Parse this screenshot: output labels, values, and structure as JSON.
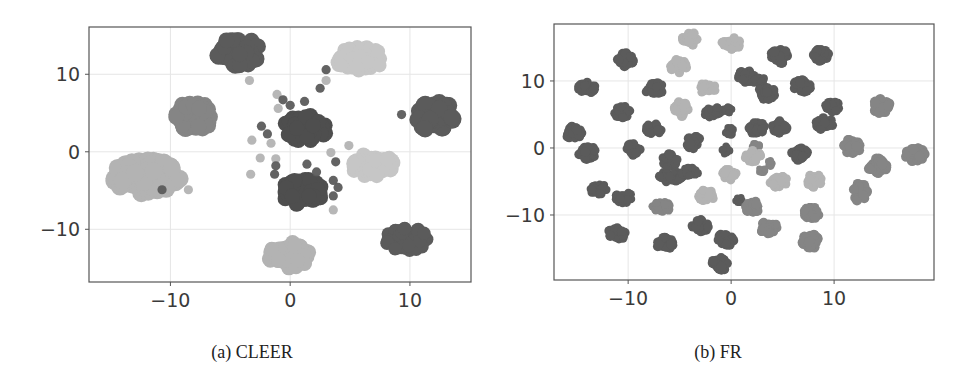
{
  "figure": {
    "captions": [
      "(a) CLEER",
      "(b) FR"
    ]
  },
  "palette": {
    "dark": "#5b5b5b",
    "darker": "#4e4e4e",
    "medium": "#858585",
    "light": "#b3b3b3",
    "lighter": "#c6c6c6",
    "frame": "#555555",
    "grid": "#e6e6e6"
  },
  "chart_data": [
    {
      "type": "scatter",
      "title": "(a) CLEER",
      "xlabel": "",
      "ylabel": "",
      "xlim": [
        -16.8,
        15.1
      ],
      "ylim": [
        -16.8,
        16.1
      ],
      "xticks": [
        -10,
        0,
        10
      ],
      "yticks": [
        -10,
        0,
        10
      ],
      "xtick_labels": [
        "−10",
        "0",
        "10"
      ],
      "ytick_labels": [
        "−10",
        "0",
        "10"
      ],
      "grid": true,
      "legend": null,
      "clusters": [
        {
          "shade": "dark",
          "x": -4.4,
          "y": 12.9,
          "rx": 2.4,
          "ry": 2.4
        },
        {
          "shade": "lighter",
          "x": 5.8,
          "y": 12.0,
          "rx": 2.7,
          "ry": 2.0
        },
        {
          "shade": "medium",
          "x": -8.1,
          "y": 4.5,
          "rx": 2.2,
          "ry": 2.4
        },
        {
          "shade": "light",
          "x": -12.0,
          "y": -3.2,
          "rx": 3.6,
          "ry": 2.8
        },
        {
          "shade": "darker",
          "x": 1.3,
          "y": 3.1,
          "rx": 2.3,
          "ry": 2.3
        },
        {
          "shade": "dark",
          "x": 12.1,
          "y": 4.6,
          "rx": 2.0,
          "ry": 2.6
        },
        {
          "shade": "lighter",
          "x": 6.9,
          "y": -1.8,
          "rx": 2.3,
          "ry": 2.1
        },
        {
          "shade": "darker",
          "x": 0.9,
          "y": -5.2,
          "rx": 2.3,
          "ry": 2.3
        },
        {
          "shade": "dark",
          "x": 9.8,
          "y": -11.3,
          "rx": 2.4,
          "ry": 1.9
        },
        {
          "shade": "light",
          "x": -0.1,
          "y": -13.3,
          "rx": 2.2,
          "ry": 2.2
        }
      ],
      "points": [
        {
          "shade": "light",
          "x": -3.4,
          "y": 9.2
        },
        {
          "shade": "light",
          "x": -1.1,
          "y": 7.4
        },
        {
          "shade": "light",
          "x": -1.0,
          "y": 5.6
        },
        {
          "shade": "dark",
          "x": -0.6,
          "y": 6.7
        },
        {
          "shade": "dark",
          "x": 0.0,
          "y": 6.0
        },
        {
          "shade": "dark",
          "x": 1.2,
          "y": 6.5
        },
        {
          "shade": "dark",
          "x": 3.0,
          "y": 10.6
        },
        {
          "shade": "light",
          "x": 3.0,
          "y": 9.2
        },
        {
          "shade": "dark",
          "x": 2.5,
          "y": 8.2
        },
        {
          "shade": "dark",
          "x": -2.4,
          "y": 3.3
        },
        {
          "shade": "dark",
          "x": -1.9,
          "y": 2.3
        },
        {
          "shade": "light",
          "x": -1.6,
          "y": 1.1
        },
        {
          "shade": "light",
          "x": -3.2,
          "y": 1.5
        },
        {
          "shade": "light",
          "x": -2.5,
          "y": -0.8
        },
        {
          "shade": "light",
          "x": -1.2,
          "y": -0.9
        },
        {
          "shade": "dark",
          "x": -1.2,
          "y": -1.8
        },
        {
          "shade": "dark",
          "x": -1.3,
          "y": -2.9
        },
        {
          "shade": "light",
          "x": -3.3,
          "y": -2.9
        },
        {
          "shade": "dark",
          "x": 9.3,
          "y": 4.8
        },
        {
          "shade": "light",
          "x": 4.9,
          "y": 0.8
        },
        {
          "shade": "light",
          "x": 3.4,
          "y": -0.1
        },
        {
          "shade": "dark",
          "x": 3.8,
          "y": -1.3
        },
        {
          "shade": "dark",
          "x": 1.4,
          "y": -1.6
        },
        {
          "shade": "dark",
          "x": 2.2,
          "y": -2.6
        },
        {
          "shade": "dark",
          "x": 3.6,
          "y": -3.7
        },
        {
          "shade": "dark",
          "x": 4.0,
          "y": -4.6
        },
        {
          "shade": "dark",
          "x": 3.6,
          "y": -5.7
        },
        {
          "shade": "light",
          "x": 3.6,
          "y": -7.5
        },
        {
          "shade": "dark",
          "x": -10.7,
          "y": -4.9
        },
        {
          "shade": "light",
          "x": -8.5,
          "y": -4.9
        }
      ]
    },
    {
      "type": "scatter",
      "title": "(b) FR",
      "xlabel": "",
      "ylabel": "",
      "xlim": [
        -17.2,
        19.7
      ],
      "ylim": [
        -19.7,
        18.5
      ],
      "xticks": [
        -10,
        0,
        10
      ],
      "yticks": [
        -10,
        0,
        10
      ],
      "xtick_labels": [
        "−10",
        "0",
        "10"
      ],
      "ytick_labels": [
        "−10",
        "0",
        "10"
      ],
      "grid": true,
      "legend": null,
      "clusters": [
        {
          "shade": "light",
          "x": -4.0,
          "y": 16.3,
          "rx": 0.9,
          "ry": 1.3
        },
        {
          "shade": "light",
          "x": 0.0,
          "y": 15.6,
          "rx": 1.2,
          "ry": 1.2
        },
        {
          "shade": "dark",
          "x": -10.3,
          "y": 13.2,
          "rx": 1.0,
          "ry": 1.4
        },
        {
          "shade": "light",
          "x": -5.1,
          "y": 12.2,
          "rx": 1.0,
          "ry": 1.3
        },
        {
          "shade": "dark",
          "x": 4.7,
          "y": 13.7,
          "rx": 1.1,
          "ry": 1.4
        },
        {
          "shade": "dark",
          "x": 8.8,
          "y": 13.8,
          "rx": 1.1,
          "ry": 1.3
        },
        {
          "shade": "dark",
          "x": -14.0,
          "y": 8.9,
          "rx": 1.1,
          "ry": 1.2
        },
        {
          "shade": "dark",
          "x": -7.4,
          "y": 8.8,
          "rx": 1.2,
          "ry": 1.2
        },
        {
          "shade": "light",
          "x": -2.3,
          "y": 9.0,
          "rx": 1.2,
          "ry": 1.1
        },
        {
          "shade": "dark",
          "x": 1.5,
          "y": 10.7,
          "rx": 1.1,
          "ry": 1.2
        },
        {
          "shade": "dark",
          "x": 2.8,
          "y": 10.0,
          "rx": 0.8,
          "ry": 0.9
        },
        {
          "shade": "dark",
          "x": 3.4,
          "y": 8.2,
          "rx": 1.1,
          "ry": 1.3
        },
        {
          "shade": "dark",
          "x": 6.9,
          "y": 9.2,
          "rx": 1.1,
          "ry": 1.3
        },
        {
          "shade": "dark",
          "x": -10.6,
          "y": 5.4,
          "rx": 1.0,
          "ry": 1.2
        },
        {
          "shade": "light",
          "x": -4.9,
          "y": 5.8,
          "rx": 0.9,
          "ry": 1.4
        },
        {
          "shade": "dark",
          "x": -1.7,
          "y": 5.3,
          "rx": 1.3,
          "ry": 1.1
        },
        {
          "shade": "dark",
          "x": -0.3,
          "y": 5.7,
          "rx": 0.6,
          "ry": 0.7
        },
        {
          "shade": "dark",
          "x": 9.8,
          "y": 6.1,
          "rx": 1.1,
          "ry": 1.2
        },
        {
          "shade": "dark",
          "x": 9.1,
          "y": 3.6,
          "rx": 1.1,
          "ry": 1.3
        },
        {
          "shade": "medium",
          "x": 14.6,
          "y": 6.3,
          "rx": 1.0,
          "ry": 1.5
        },
        {
          "shade": "dark",
          "x": -15.3,
          "y": 2.3,
          "rx": 1.0,
          "ry": 1.3
        },
        {
          "shade": "dark",
          "x": -7.5,
          "y": 2.8,
          "rx": 1.1,
          "ry": 1.1
        },
        {
          "shade": "dark",
          "x": -0.2,
          "y": 2.5,
          "rx": 0.6,
          "ry": 0.8
        },
        {
          "shade": "dark",
          "x": 2.4,
          "y": 3.0,
          "rx": 1.1,
          "ry": 1.3
        },
        {
          "shade": "dark",
          "x": 4.7,
          "y": 3.2,
          "rx": 1.1,
          "ry": 1.3
        },
        {
          "shade": "dark",
          "x": -14.0,
          "y": -0.7,
          "rx": 1.1,
          "ry": 1.3
        },
        {
          "shade": "dark",
          "x": -9.5,
          "y": -0.2,
          "rx": 1.0,
          "ry": 1.2
        },
        {
          "shade": "dark",
          "x": -3.7,
          "y": 0.9,
          "rx": 0.9,
          "ry": 1.3
        },
        {
          "shade": "dark",
          "x": -0.5,
          "y": -0.3,
          "rx": 0.5,
          "ry": 0.8
        },
        {
          "shade": "medium",
          "x": 2.4,
          "y": 0.2,
          "rx": 0.5,
          "ry": 0.7
        },
        {
          "shade": "light",
          "x": 2.1,
          "y": -1.3,
          "rx": 1.0,
          "ry": 1.2
        },
        {
          "shade": "dark",
          "x": 6.7,
          "y": -0.8,
          "rx": 1.0,
          "ry": 1.4
        },
        {
          "shade": "medium",
          "x": 11.7,
          "y": 0.3,
          "rx": 1.2,
          "ry": 1.4
        },
        {
          "shade": "medium",
          "x": 17.9,
          "y": -1.1,
          "rx": 1.2,
          "ry": 1.5
        },
        {
          "shade": "dark",
          "x": -6.0,
          "y": -1.9,
          "rx": 1.0,
          "ry": 1.3
        },
        {
          "shade": "dark",
          "x": -5.8,
          "y": -4.3,
          "rx": 1.8,
          "ry": 1.1
        },
        {
          "shade": "dark",
          "x": -4.0,
          "y": -3.6,
          "rx": 1.1,
          "ry": 0.9
        },
        {
          "shade": "light",
          "x": -0.2,
          "y": -4.0,
          "rx": 0.9,
          "ry": 1.2
        },
        {
          "shade": "medium",
          "x": 3.9,
          "y": -2.3,
          "rx": 0.5,
          "ry": 0.6
        },
        {
          "shade": "medium",
          "x": 3.0,
          "y": -3.3,
          "rx": 0.5,
          "ry": 0.6
        },
        {
          "shade": "light",
          "x": 4.6,
          "y": -5.0,
          "rx": 1.1,
          "ry": 1.2
        },
        {
          "shade": "light",
          "x": 8.1,
          "y": -4.9,
          "rx": 0.9,
          "ry": 1.3
        },
        {
          "shade": "medium",
          "x": 14.2,
          "y": -2.7,
          "rx": 1.2,
          "ry": 1.5
        },
        {
          "shade": "medium",
          "x": 12.5,
          "y": -6.6,
          "rx": 0.9,
          "ry": 1.8
        },
        {
          "shade": "dark",
          "x": -12.8,
          "y": -6.2,
          "rx": 1.2,
          "ry": 1.0
        },
        {
          "shade": "dark",
          "x": -10.4,
          "y": -7.4,
          "rx": 1.1,
          "ry": 1.1
        },
        {
          "shade": "light",
          "x": -2.4,
          "y": -7.1,
          "rx": 1.1,
          "ry": 1.2
        },
        {
          "shade": "medium",
          "x": -6.7,
          "y": -8.8,
          "rx": 1.2,
          "ry": 1.0
        },
        {
          "shade": "dark",
          "x": 0.8,
          "y": -7.7,
          "rx": 0.5,
          "ry": 0.7
        },
        {
          "shade": "medium",
          "x": 2.1,
          "y": -8.7,
          "rx": 1.1,
          "ry": 1.3
        },
        {
          "shade": "medium",
          "x": 7.7,
          "y": -9.7,
          "rx": 1.2,
          "ry": 1.2
        },
        {
          "shade": "dark",
          "x": -11.1,
          "y": -12.7,
          "rx": 1.1,
          "ry": 1.3
        },
        {
          "shade": "dark",
          "x": -3.0,
          "y": -11.6,
          "rx": 1.1,
          "ry": 1.2
        },
        {
          "shade": "dark",
          "x": -0.5,
          "y": -13.6,
          "rx": 1.0,
          "ry": 1.3
        },
        {
          "shade": "medium",
          "x": 3.6,
          "y": -11.9,
          "rx": 1.2,
          "ry": 1.2
        },
        {
          "shade": "dark",
          "x": -6.4,
          "y": -14.3,
          "rx": 1.1,
          "ry": 1.3
        },
        {
          "shade": "medium",
          "x": 7.8,
          "y": -13.9,
          "rx": 1.1,
          "ry": 1.5
        },
        {
          "shade": "dark",
          "x": -1.1,
          "y": -17.3,
          "rx": 1.0,
          "ry": 1.3
        }
      ]
    }
  ]
}
